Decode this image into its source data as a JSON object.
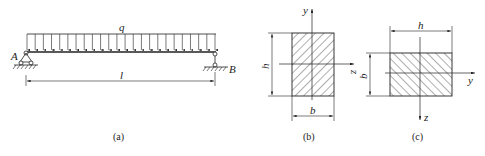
{
  "figure_a": {
    "load_label": "q",
    "support_left_label": "A",
    "support_right_label": "B",
    "span_label": "l",
    "caption": "(a)",
    "arrow_count": 24
  },
  "figure_b": {
    "height_label": "h",
    "width_label": "b",
    "vertical_axis_label": "y",
    "horizontal_axis_label": "z",
    "caption": "(b)"
  },
  "figure_c": {
    "width_label": "h",
    "height_label": "b",
    "horizontal_axis_label": "y",
    "vertical_axis_label": "z",
    "caption": "(c)"
  },
  "colors": {
    "line": "#222222",
    "background": "#ffffff"
  }
}
